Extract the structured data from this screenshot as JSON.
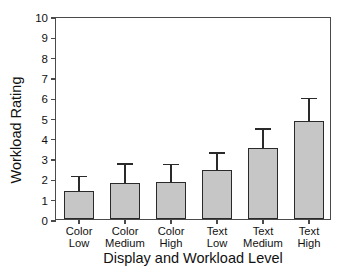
{
  "chart_data": {
    "type": "bar",
    "title": "",
    "xlabel": "Display and Workload Level",
    "ylabel": "Workload Rating",
    "categories": [
      "Color Low",
      "Color Medium",
      "Color High",
      "Text Low",
      "Text Medium",
      "Text High"
    ],
    "category_lines": [
      [
        "Color",
        "Low"
      ],
      [
        "Color",
        "Medium"
      ],
      [
        "Color",
        "High"
      ],
      [
        "Text",
        "Low"
      ],
      [
        "Text",
        "Medium"
      ],
      [
        "Text",
        "High"
      ]
    ],
    "values": [
      1.38,
      1.78,
      1.83,
      2.43,
      3.48,
      4.85
    ],
    "error_upper": [
      2.05,
      2.68,
      2.65,
      3.2,
      4.4,
      5.9
    ],
    "error_type": "upper-only",
    "ylim": [
      0,
      10
    ],
    "ytick_labels": [
      "0",
      "1",
      "2",
      "3",
      "4",
      "5",
      "6",
      "7",
      "8",
      "9",
      "10"
    ],
    "ytick_values": [
      0,
      1,
      2,
      3,
      4,
      5,
      6,
      7,
      8,
      9,
      10
    ],
    "grid": false,
    "legend": null,
    "bar_fill_color": "#c6c6c6",
    "bar_edge_color": "#2a2a2a",
    "axis_color": "#4a4a4a"
  }
}
